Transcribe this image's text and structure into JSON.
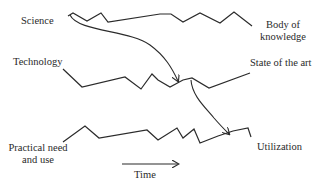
{
  "diagram": {
    "labels": {
      "science": "Science",
      "technology": "Technology",
      "practical_line1": "Practical need",
      "practical_line2": "and use",
      "body_line1": "Body of",
      "body_line2": "knowledge",
      "state_of_art": "State of the art",
      "utilization": "Utilization",
      "time": "Time"
    },
    "colors": {
      "line": "#2b2b2b",
      "text": "#2a2a2a",
      "background": "#ffffff"
    }
  }
}
